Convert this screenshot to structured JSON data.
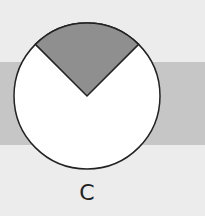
{
  "figure": {
    "label": "C",
    "shaded_fraction": "1/4",
    "wedge_angle_deg": 90,
    "colors": {
      "background": "#ececec",
      "band": "#c6c6c6",
      "circle_fill": "#ffffff",
      "wedge_fill": "#8f8f8f",
      "outline": "#222222"
    }
  }
}
